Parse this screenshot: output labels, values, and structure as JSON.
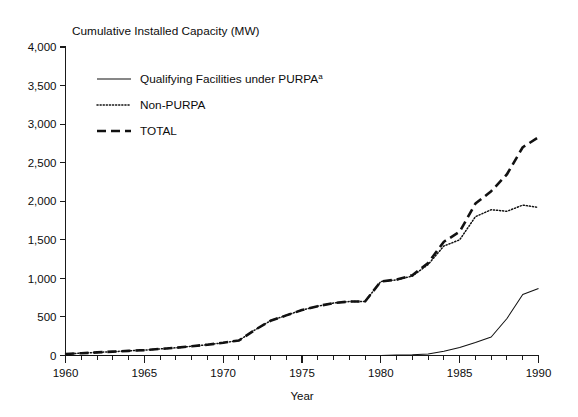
{
  "chart_data": {
    "type": "line",
    "title": "Cumulative Installed Capacity (MW)",
    "xlabel": "Year",
    "ylabel": "",
    "xlim": [
      1960,
      1990
    ],
    "ylim": [
      0,
      4000
    ],
    "ytick_labels": [
      "0",
      "500",
      "1,000",
      "1,500",
      "2,000",
      "2,500",
      "3,000",
      "3,500",
      "4,000"
    ],
    "ytick_values": [
      0,
      500,
      1000,
      1500,
      2000,
      2500,
      3000,
      3500,
      4000
    ],
    "xtick_labels": [
      "1960",
      "1965",
      "1970",
      "1975",
      "1980",
      "1985",
      "1990"
    ],
    "xtick_values": [
      1960,
      1965,
      1970,
      1975,
      1980,
      1985,
      1990
    ],
    "x_minor_step": 1,
    "grid": false,
    "legend_position": "upper-left-inside",
    "x": [
      1960,
      1961,
      1962,
      1963,
      1964,
      1965,
      1966,
      1967,
      1968,
      1969,
      1970,
      1971,
      1972,
      1973,
      1974,
      1975,
      1976,
      1977,
      1978,
      1979,
      1980,
      1981,
      1982,
      1983,
      1984,
      1985,
      1986,
      1987,
      1988,
      1989,
      1990
    ],
    "series": [
      {
        "name": "Qualifying Facilities under PURPA",
        "superscript": "a",
        "style": "solid",
        "values": [
          0,
          0,
          0,
          0,
          0,
          0,
          0,
          0,
          0,
          0,
          0,
          0,
          0,
          0,
          0,
          0,
          0,
          0,
          0,
          0,
          0,
          5,
          10,
          20,
          55,
          105,
          170,
          240,
          480,
          790,
          870
        ]
      },
      {
        "name": "Non-PURPA",
        "style": "dotted",
        "values": [
          20,
          30,
          40,
          50,
          60,
          70,
          85,
          100,
          120,
          140,
          165,
          195,
          330,
          450,
          520,
          590,
          640,
          680,
          700,
          700,
          960,
          980,
          1030,
          1180,
          1420,
          1500,
          1800,
          1890,
          1870,
          1950,
          1920
        ]
      },
      {
        "name": "TOTAL",
        "style": "dashed",
        "values": [
          20,
          30,
          40,
          50,
          60,
          70,
          85,
          100,
          120,
          140,
          165,
          195,
          330,
          450,
          520,
          590,
          640,
          680,
          700,
          700,
          960,
          985,
          1040,
          1200,
          1475,
          1605,
          1970,
          2130,
          2350,
          2700,
          2830
        ]
      }
    ],
    "legend": [
      {
        "label": "Qualifying Facilities under PURPA",
        "superscript": "a",
        "style": "solid"
      },
      {
        "label": "Non-PURPA",
        "superscript": "",
        "style": "dotted"
      },
      {
        "label": "TOTAL",
        "superscript": "",
        "style": "dashed"
      }
    ],
    "colors": {
      "line": "#111111",
      "axis": "#1a1a1a",
      "text": "#0d0d0d",
      "background": "#ffffff"
    }
  }
}
